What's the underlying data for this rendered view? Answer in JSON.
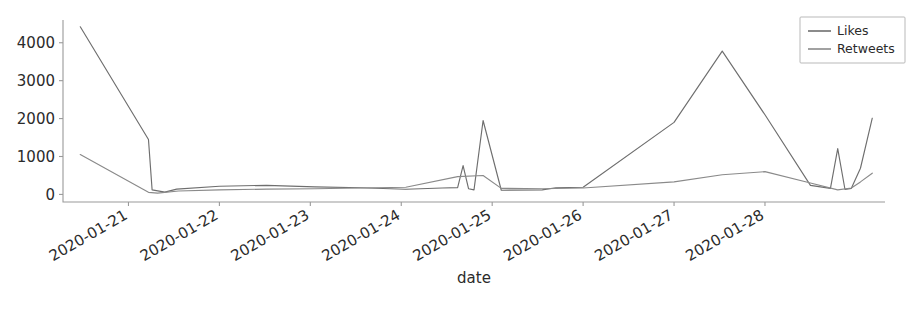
{
  "chart_data": {
    "type": "line",
    "title": "",
    "xlabel": "date",
    "ylabel": "",
    "grid": false,
    "legend_position": "top-right",
    "xlim": [
      "2020-01-20T12:00",
      "2020-01-28T20:00"
    ],
    "ylim": [
      -200,
      4600
    ],
    "yticks": [
      0,
      1000,
      2000,
      3000,
      4000
    ],
    "ytick_labels": [
      "0",
      "1000",
      "2000",
      "3000",
      "4000"
    ],
    "xticks": [
      "2020-01-21",
      "2020-01-22",
      "2020-01-23",
      "2020-01-24",
      "2020-01-25",
      "2020-01-26",
      "2020-01-27",
      "2020-01-28"
    ],
    "xtick_labels": [
      "2020-01-21",
      "2020-01-22",
      "2020-01-23",
      "2020-01-24",
      "2020-01-25",
      "2020-01-26",
      "2020-01-27",
      "2020-01-28"
    ],
    "series": [
      {
        "name": "Likes",
        "color": "#6e6e6e",
        "x": [
          -0.53,
          0.22,
          0.26,
          0.4,
          0.53,
          1.0,
          1.52,
          2.05,
          2.55,
          3.05,
          3.45,
          3.62,
          3.68,
          3.74,
          3.8,
          3.9,
          4.1,
          4.55,
          4.7,
          5.0,
          6.0,
          6.53,
          7.0,
          7.5,
          7.72,
          7.8,
          7.88,
          7.95,
          8.05,
          8.18
        ],
        "y": [
          4420,
          1450,
          120,
          60,
          140,
          215,
          240,
          200,
          175,
          135,
          170,
          180,
          760,
          150,
          120,
          1950,
          110,
          120,
          175,
          190,
          1900,
          3780,
          2100,
          240,
          160,
          1210,
          130,
          160,
          690,
          2010
        ]
      },
      {
        "name": "Retweets",
        "color": "#8a8a8a",
        "x": [
          -0.53,
          0.22,
          0.32,
          0.55,
          1.0,
          1.52,
          2.05,
          2.55,
          3.05,
          3.62,
          3.9,
          4.1,
          4.55,
          5.0,
          6.0,
          6.53,
          7.0,
          7.5,
          7.8,
          7.95,
          8.05,
          8.18
        ],
        "y": [
          1050,
          55,
          35,
          90,
          120,
          140,
          150,
          170,
          190,
          470,
          500,
          160,
          150,
          170,
          330,
          520,
          600,
          300,
          120,
          170,
          330,
          560
        ]
      }
    ],
    "legend": [
      {
        "label": "Likes",
        "color": "#6e6e6e"
      },
      {
        "label": "Retweets",
        "color": "#8a8a8a"
      }
    ]
  },
  "figure": {
    "background": "#ffffff",
    "axis_color": "#9a9a9a",
    "text_color": "#2b2b2b"
  }
}
